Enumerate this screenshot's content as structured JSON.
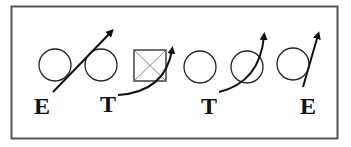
{
  "diagram": {
    "labels": [
      {
        "id": "left-end",
        "text": "E"
      },
      {
        "id": "left-tackle",
        "text": "T"
      },
      {
        "id": "right-tackle",
        "text": "T"
      },
      {
        "id": "right-end",
        "text": "E"
      }
    ],
    "players": [
      "circle",
      "circle",
      "center-square",
      "circle",
      "circle",
      "circle"
    ],
    "colors": {
      "stroke": "#222222",
      "frame": "#555555",
      "background": "#ffffff"
    }
  }
}
